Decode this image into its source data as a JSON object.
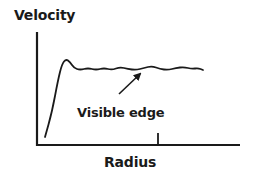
{
  "chart_data": {
    "type": "line",
    "title": "",
    "xlabel": "Radius",
    "ylabel": "Velocity",
    "grid": false,
    "legend": null,
    "tick_marks": {
      "x": [
        1
      ]
    },
    "annotations": [
      {
        "text": "Visible edge",
        "arrow_to": "curve near visible-edge tick"
      }
    ],
    "series": [
      {
        "name": "rotation curve",
        "points_px": [
          [
            45,
            137
          ],
          [
            52,
            112
          ],
          [
            58,
            80
          ],
          [
            62,
            64
          ],
          [
            66,
            59
          ],
          [
            70,
            62
          ],
          [
            74,
            68
          ],
          [
            80,
            70
          ],
          [
            88,
            68
          ],
          [
            96,
            70
          ],
          [
            104,
            68
          ],
          [
            112,
            70
          ],
          [
            120,
            67
          ],
          [
            128,
            69
          ],
          [
            136,
            70
          ],
          [
            144,
            68
          ],
          [
            152,
            66
          ],
          [
            160,
            69
          ],
          [
            168,
            70
          ],
          [
            176,
            68
          ],
          [
            184,
            67
          ],
          [
            192,
            69
          ],
          [
            198,
            68
          ],
          [
            203,
            70
          ]
        ]
      }
    ]
  },
  "labels": {
    "ylabel": "Velocity",
    "xlabel": "Radius",
    "annotation": "Visible edge"
  },
  "colors": {
    "stroke": "#1a1a1a",
    "background": "#ffffff"
  }
}
